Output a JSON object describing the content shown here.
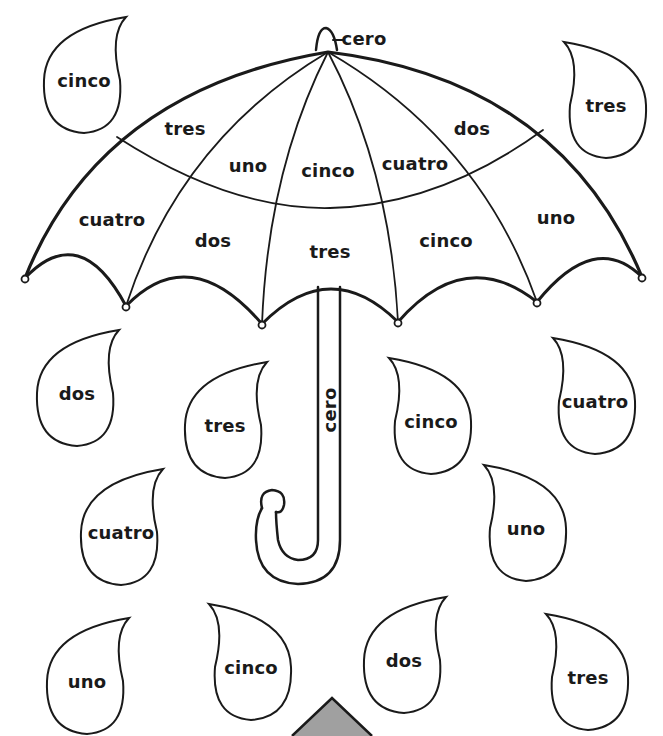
{
  "worksheet": {
    "umbrella": {
      "top_label": "cero",
      "handle_label": "cero",
      "panels": [
        {
          "label": "tres",
          "x": 185,
          "y": 128
        },
        {
          "label": "uno",
          "x": 248,
          "y": 165
        },
        {
          "label": "cinco",
          "x": 328,
          "y": 170
        },
        {
          "label": "cuatro",
          "x": 415,
          "y": 163
        },
        {
          "label": "dos",
          "x": 472,
          "y": 128
        },
        {
          "label": "cuatro",
          "x": 112,
          "y": 219
        },
        {
          "label": "dos",
          "x": 213,
          "y": 240
        },
        {
          "label": "tres",
          "x": 330,
          "y": 251
        },
        {
          "label": "cinco",
          "x": 446,
          "y": 240
        },
        {
          "label": "uno",
          "x": 556,
          "y": 217
        }
      ]
    },
    "raindrops": [
      {
        "label": "cinco",
        "x": 84,
        "y": 75,
        "dir": "right"
      },
      {
        "label": "tres",
        "x": 606,
        "y": 100,
        "dir": "left"
      },
      {
        "label": "dos",
        "x": 77,
        "y": 388,
        "dir": "right"
      },
      {
        "label": "tres",
        "x": 225,
        "y": 420,
        "dir": "right"
      },
      {
        "label": "cinco",
        "x": 431,
        "y": 416,
        "dir": "left"
      },
      {
        "label": "cuatro",
        "x": 595,
        "y": 396,
        "dir": "left"
      },
      {
        "label": "cuatro",
        "x": 121,
        "y": 527,
        "dir": "right"
      },
      {
        "label": "uno",
        "x": 526,
        "y": 523,
        "dir": "left"
      },
      {
        "label": "uno",
        "x": 87,
        "y": 676,
        "dir": "right"
      },
      {
        "label": "cinco",
        "x": 251,
        "y": 662,
        "dir": "left"
      },
      {
        "label": "dos",
        "x": 404,
        "y": 655,
        "dir": "right"
      },
      {
        "label": "tres",
        "x": 588,
        "y": 672,
        "dir": "left"
      }
    ],
    "marker_color": "#a0a0a0",
    "line_color": "#1a1a1a"
  }
}
